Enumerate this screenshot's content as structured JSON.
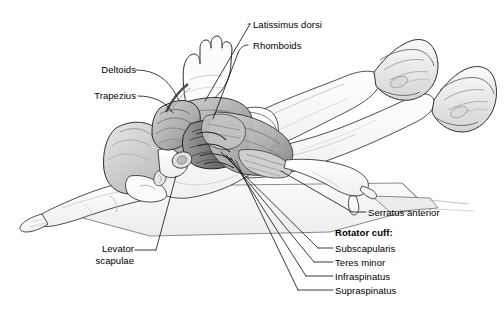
{
  "figure": {
    "background_color": "#ffffff",
    "line_color": "#1a1a1a",
    "text_color": "#000000",
    "skin_tone": "#fbfbfb",
    "muscle_light": "#dcdcdc",
    "muscle_mid": "#a9a9a9",
    "muscle_dark": "#5a5a5a",
    "mat_fill": "#f4f4f4",
    "width": 504,
    "height": 315
  },
  "labels": {
    "latissimus_dorsi": "Latissimus dorsi",
    "rhomboids": "Rhomboids",
    "deltoids": "Deltoids",
    "trapezius": "Trapezius",
    "levator_scapulae": "Levator\nscapulae",
    "serratus_anterior": "Serratus anterior",
    "rotator_cuff_heading": "Rotator cuff:",
    "subscapularis": "Subscapularis",
    "teres_minor": "Teres minor",
    "infraspinatus": "Infraspinatus",
    "supraspinatus": "Supraspinatus"
  },
  "label_list": [
    {
      "key": "latissimus_dorsi",
      "text": "Latissimus dorsi",
      "side": "right",
      "bold": false
    },
    {
      "key": "rhomboids",
      "text": "Rhomboids",
      "side": "right",
      "bold": false
    },
    {
      "key": "deltoids",
      "text": "Deltoids",
      "side": "left",
      "bold": false
    },
    {
      "key": "trapezius",
      "text": "Trapezius",
      "side": "left",
      "bold": false
    },
    {
      "key": "levator_scapulae",
      "text": "Levator scapulae",
      "side": "left",
      "bold": false
    },
    {
      "key": "serratus_anterior",
      "text": "Serratus anterior",
      "side": "right",
      "bold": false
    },
    {
      "key": "rotator_cuff_heading",
      "text": "Rotator cuff:",
      "side": "right",
      "bold": true
    },
    {
      "key": "subscapularis",
      "text": "Subscapularis",
      "side": "right",
      "bold": false
    },
    {
      "key": "teres_minor",
      "text": "Teres minor",
      "side": "right",
      "bold": false
    },
    {
      "key": "infraspinatus",
      "text": "Infraspinatus",
      "side": "right",
      "bold": false
    },
    {
      "key": "supraspinatus",
      "text": "Supraspinatus",
      "side": "right",
      "bold": false
    }
  ]
}
